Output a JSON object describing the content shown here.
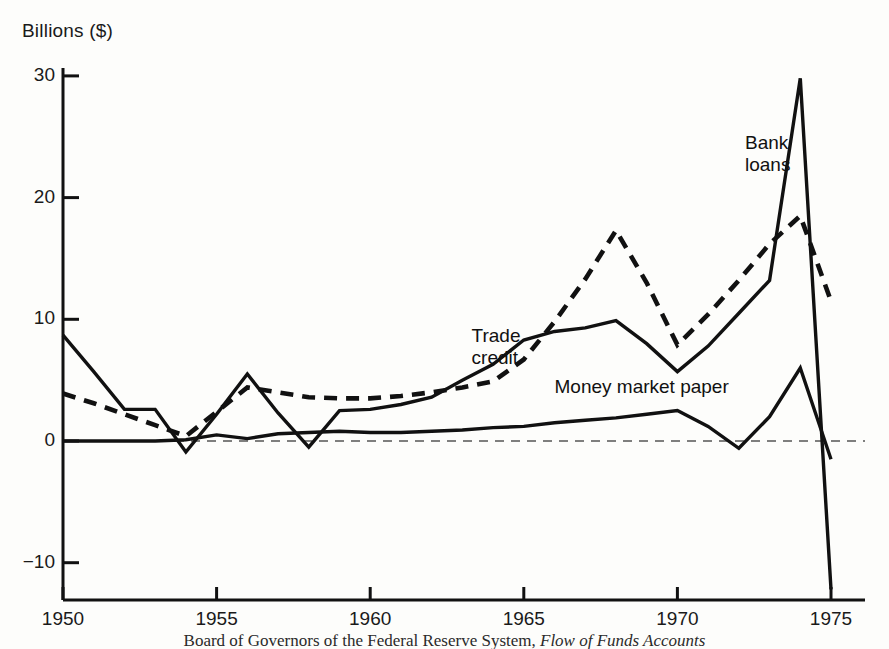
{
  "chart_data": {
    "type": "line",
    "title": "",
    "subtitle": "",
    "xlabel": "",
    "ylabel": "Billions ($)",
    "xlim": [
      1950,
      1975
    ],
    "ylim": [
      -13,
      31
    ],
    "yticks": [
      30,
      20,
      10,
      0,
      -10
    ],
    "ytick_labels": [
      "30",
      "20",
      "10",
      "0",
      "−10"
    ],
    "xticks": [
      1950,
      1955,
      1960,
      1965,
      1970,
      1975
    ],
    "xtick_labels": [
      "1950",
      "1955",
      "1960",
      "1965",
      "1970",
      "1975"
    ],
    "grid": false,
    "zero_line": true,
    "zero_line_style": "dashed",
    "legend_position": "inline-annotations",
    "x": [
      1950,
      1951,
      1952,
      1953,
      1954,
      1955,
      1956,
      1957,
      1958,
      1959,
      1960,
      1961,
      1962,
      1963,
      1964,
      1965,
      1966,
      1967,
      1968,
      1969,
      1970,
      1971,
      1972,
      1973,
      1974,
      1975
    ],
    "series": [
      {
        "name": "Bank loans",
        "style": "solid",
        "color": "#111111",
        "values": [
          8.7,
          5.7,
          2.6,
          2.6,
          -0.9,
          2.2,
          5.5,
          2.3,
          -0.5,
          2.5,
          2.6,
          3.0,
          3.6,
          5.0,
          6.3,
          8.3,
          9.0,
          9.3,
          9.9,
          8.0,
          5.7,
          7.8,
          10.5,
          13.2,
          29.8,
          -12.2
        ]
      },
      {
        "name": "Trade credit",
        "style": "dashed",
        "color": "#111111",
        "values": [
          3.9,
          3.1,
          2.2,
          1.3,
          0.4,
          2.4,
          4.4,
          4.0,
          3.6,
          3.5,
          3.5,
          3.7,
          4.0,
          4.4,
          4.9,
          6.7,
          9.8,
          13.3,
          17.3,
          13.0,
          7.9,
          10.4,
          13.2,
          16.2,
          18.5,
          11.5
        ]
      },
      {
        "name": "Money market paper",
        "style": "solid",
        "color": "#111111",
        "values": [
          0.0,
          0.0,
          0.0,
          0.0,
          0.1,
          0.5,
          0.2,
          0.6,
          0.7,
          0.8,
          0.7,
          0.7,
          0.8,
          0.9,
          1.1,
          1.2,
          1.5,
          1.7,
          1.9,
          2.2,
          2.5,
          1.2,
          -0.6,
          2.0,
          6.0,
          -1.5
        ]
      }
    ],
    "annotations": [
      {
        "text": "Bank loans",
        "x": 1972.2,
        "y": 24.5
      },
      {
        "text": "Trade credit",
        "x": 1963.3,
        "y": 8.6
      },
      {
        "text": "Money market paper",
        "x": 1966.0,
        "y": 4.4
      }
    ]
  },
  "axis": {
    "y_title": "Billions ($)"
  },
  "labels": {
    "bank_loans": "Bank\nloans",
    "trade_credit": "Trade\ncredit",
    "money_market_paper": "Money market paper"
  },
  "caption": {
    "prefix": "Board of Governors of the Federal Reserve System, ",
    "italic": "Flow of Funds Accounts"
  }
}
